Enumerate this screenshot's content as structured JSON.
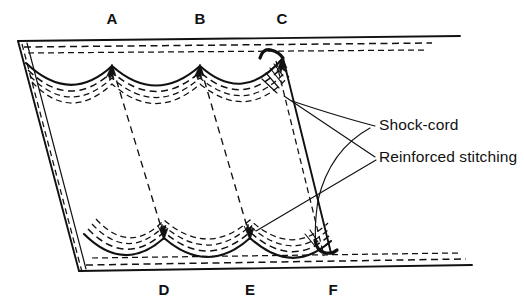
{
  "figure": {
    "background_color": "#ffffff",
    "ink_color": "#111111"
  },
  "letter_labels": {
    "top": [
      {
        "text": "A",
        "x": 112,
        "y": 20
      },
      {
        "text": "B",
        "x": 200,
        "y": 20
      },
      {
        "text": "C",
        "x": 282,
        "y": 20
      }
    ],
    "bottom": [
      {
        "text": "D",
        "x": 164,
        "y": 291
      },
      {
        "text": "E",
        "x": 250,
        "y": 291
      },
      {
        "text": "F",
        "x": 333,
        "y": 291
      }
    ]
  },
  "callouts": [
    {
      "name": "shock-cord",
      "text": "Shock-cord",
      "x": 379,
      "y": 126
    },
    {
      "name": "reinforced-stitching",
      "text": "Reinforced stitching",
      "x": 379,
      "y": 158
    }
  ],
  "geometry": {
    "top_edge_solid": "M 18,41 L 460,36",
    "top_edge_dash_1": "M 22,47 L 432,44",
    "top_edge_dash_2": "M 26,53 L 428,51",
    "left_edge_outer": "M 18,41 L 78,270",
    "left_edge_inner": "M 25,42 L 84,269",
    "left_edge_dash": "M 22,45 L 81,272",
    "bottom_edge_solid": "M 78,271 L 470,265",
    "bottom_edge_dash_1": "M 84,265 L 462,259",
    "bottom_edge_dash_2": "M 88,259 L 455,254",
    "right_edge_outer": "M 283,58 L 330,252",
    "right_edge_dash": "M 277,60 L 325,254",
    "top_scallops": "M 26,63 Q 70,103 112,66 Q 156,103 200,66 Q 242,103 283,58",
    "bottom_scallops": "M 84,236 Q 124,272 164,238 Q 208,274 250,238 Q 292,274 330,240",
    "seam_a_d": "M 113,68 L 164,238",
    "seam_b_e": "M 201,68 L 250,238",
    "cord_top_hook": "M 262,58 q 8,-12 16,-5 q 6,3 7,8",
    "cord_bottom_hook": "M 316,245 q 4,12 14,10 q 6,-1 8,-4"
  },
  "annotation_targets": {
    "shock_cord_target": "upper-right scallop cord channel",
    "stitching_target_upper": "upper-right scallop stitch rows",
    "stitching_target_lower": "lower scallop peak at E"
  }
}
